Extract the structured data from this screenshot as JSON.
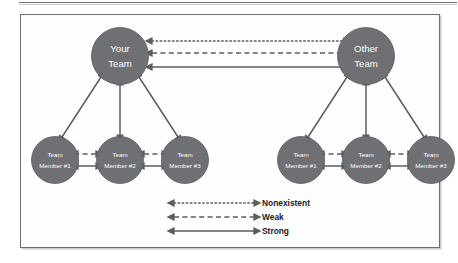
{
  "figure": {
    "background_color": "#fefefe",
    "frame_color": "#6a6d71",
    "node_fill": "#6e7073",
    "node_text_color": "#ffffff",
    "edge_color": "#5a5c5f"
  },
  "nodes": {
    "your_team": {
      "line1": "Your",
      "line2": "Team"
    },
    "other_team": {
      "line1": "Other",
      "line2": "Team"
    },
    "left_members": [
      {
        "line1": "Team",
        "line2": "Member #1"
      },
      {
        "line1": "Team",
        "line2": "Member #2"
      },
      {
        "line1": "Team",
        "line2": "Member #3"
      }
    ],
    "right_members": [
      {
        "line1": "Team",
        "line2": "Member #1"
      },
      {
        "line1": "Team",
        "line2": "Member #2"
      },
      {
        "line1": "Team",
        "line2": "Member #3"
      }
    ]
  },
  "legend": {
    "items": [
      {
        "label": "Nonexistent",
        "style": "dotted"
      },
      {
        "label": "Weak",
        "style": "dashed"
      },
      {
        "label": "Strong",
        "style": "solid"
      }
    ]
  },
  "relationships": {
    "between_teams": [
      "Nonexistent",
      "Weak",
      "Strong"
    ],
    "team_to_member": "Strong",
    "member_to_member": [
      "Weak",
      "Strong"
    ]
  }
}
